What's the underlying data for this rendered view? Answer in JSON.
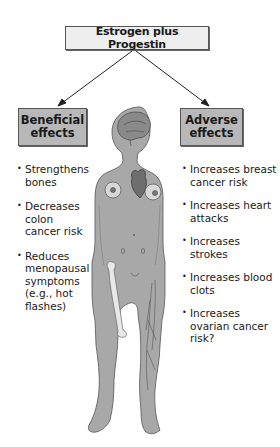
{
  "title": "Estrogen plus Progestin",
  "beneficial": {
    "heading": "Beneficial effects",
    "items": [
      "Strengthens bones",
      "Decreases colon cancer risk",
      "Reduces menopausal symptoms (e.g., hot flashes)"
    ]
  },
  "adverse": {
    "heading": "Adverse effects",
    "items": [
      "Increases breast cancer risk",
      "Increases heart attacks",
      "Increases strokes",
      "Increases blood clots",
      "Increases ovarian cancer risk?"
    ]
  },
  "figure": {
    "organs": [
      "brain",
      "heart",
      "breasts",
      "ovaries",
      "femur-bone",
      "leg-veins"
    ],
    "colors": {
      "body": "#a8a8a8",
      "outline": "#555555",
      "bone": "#e8e8e8",
      "organ": "#7a7a7a"
    }
  }
}
